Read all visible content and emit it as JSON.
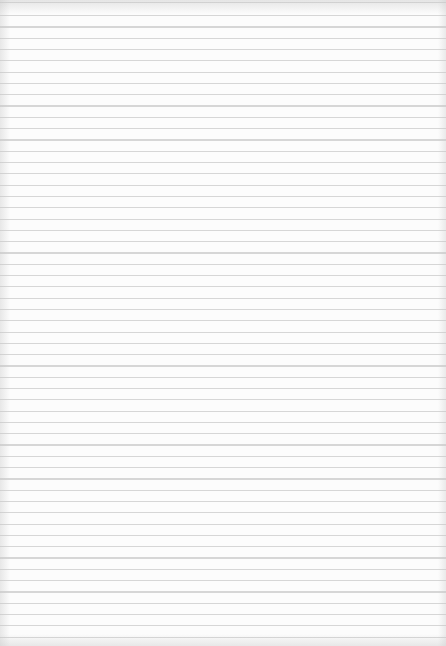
{
  "paper": {
    "type": "lined-paper",
    "background_color": "#fcfcfc",
    "line_color": "#d6d6d6",
    "line_spacing_px": 11.3,
    "line_count": 56
  }
}
